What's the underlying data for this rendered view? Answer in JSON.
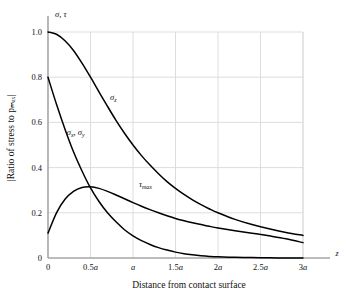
{
  "figure": {
    "top_axis_label": "σ, τ",
    "y_axis_label": "|Ratio of stress to  pₘₐₓ|",
    "x_axis_label": "Distance from contact surface",
    "x_axis_symbol": "z",
    "colors": {
      "curve": "#000000",
      "grid": "#d9d9d9",
      "axis": "#a6a6a6",
      "text": "#111111"
    }
  },
  "chart_data": {
    "type": "line",
    "title": "",
    "subtitle": "",
    "xlabel": "Distance from contact surface",
    "ylabel": "|Ratio of stress to p_max|",
    "x_axis_symbol": "z",
    "top_axis_label": "σ, τ",
    "grid": true,
    "legend": "inline-annotations",
    "xlim": [
      0,
      3
    ],
    "ylim": [
      0,
      1.0
    ],
    "xticks": [
      0,
      0.5,
      1,
      1.5,
      2,
      2.5,
      3
    ],
    "xticklabels": [
      "0",
      "0.5a",
      "a",
      "1.5a",
      "2a",
      "2.5a",
      "3a"
    ],
    "yticks": [
      0,
      0.2,
      0.4,
      0.6,
      0.8,
      1.0
    ],
    "yticklabels": [
      "0",
      "0.2",
      "0.4",
      "0.6",
      "0.8",
      "1.0"
    ],
    "x": [
      0,
      0.1,
      0.2,
      0.3,
      0.4,
      0.5,
      0.6,
      0.7,
      0.8,
      0.9,
      1.0,
      1.1,
      1.2,
      1.3,
      1.4,
      1.5,
      1.6,
      1.7,
      1.8,
      1.9,
      2.0,
      2.2,
      2.4,
      2.6,
      2.8,
      3.0
    ],
    "series": [
      {
        "name": "σ_z",
        "label": "σ",
        "label_sub": "z",
        "annotation_x": 0.73,
        "annotation_y": 0.7,
        "values": [
          1.0,
          0.99,
          0.961,
          0.918,
          0.862,
          0.8,
          0.735,
          0.671,
          0.609,
          0.552,
          0.5,
          0.453,
          0.411,
          0.373,
          0.338,
          0.308,
          0.281,
          0.257,
          0.236,
          0.217,
          0.2,
          0.171,
          0.148,
          0.129,
          0.113,
          0.1
        ]
      },
      {
        "name": "σ_x, σ_y",
        "label": "σ",
        "label_sub": "x",
        "label2": "σ",
        "label2_sub": "y",
        "annotation_x": 0.22,
        "annotation_y": 0.545,
        "values": [
          0.8,
          0.68,
          0.57,
          0.47,
          0.385,
          0.31,
          0.25,
          0.2,
          0.16,
          0.125,
          0.098,
          0.077,
          0.06,
          0.046,
          0.035,
          0.026,
          0.019,
          0.014,
          0.01,
          0.007,
          0.005,
          0.003,
          0.002,
          0.001,
          0.0,
          0.0
        ]
      },
      {
        "name": "τ_max",
        "label": "τ",
        "label_sub": "max",
        "annotation_x": 1.07,
        "annotation_y": 0.315,
        "values": [
          0.11,
          0.2,
          0.26,
          0.295,
          0.312,
          0.315,
          0.308,
          0.295,
          0.279,
          0.262,
          0.245,
          0.229,
          0.214,
          0.2,
          0.187,
          0.175,
          0.165,
          0.156,
          0.148,
          0.14,
          0.133,
          0.121,
          0.11,
          0.098,
          0.085,
          0.068
        ]
      }
    ]
  }
}
